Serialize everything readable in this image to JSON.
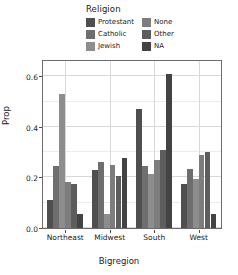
{
  "chart_data": {
    "type": "bar",
    "title": "",
    "xlabel": "Bigregion",
    "ylabel": "Prop",
    "categories": [
      "Northeast",
      "Midwest",
      "South",
      "West"
    ],
    "legend_title": "Religion",
    "legend_position": "top",
    "grid": true,
    "ylim": [
      0.0,
      0.66
    ],
    "yticks": [
      "0.0",
      "0.2",
      "0.4",
      "0.6"
    ],
    "ytick_values": [
      0.0,
      0.2,
      0.4,
      0.6
    ],
    "series": [
      {
        "name": "Protestant",
        "color": "#4f4f4f",
        "values": [
          0.11,
          0.23,
          0.47,
          0.175
        ]
      },
      {
        "name": "Catholic",
        "color": "#6e6e6e",
        "values": [
          0.245,
          0.26,
          0.245,
          0.235
        ]
      },
      {
        "name": "Jewish",
        "color": "#8d8d8d",
        "values": [
          0.53,
          0.055,
          0.215,
          0.195
        ]
      },
      {
        "name": "None",
        "color": "#7d7d7d",
        "values": [
          0.18,
          0.25,
          0.27,
          0.29
        ]
      },
      {
        "name": "Other",
        "color": "#5d5d5d",
        "values": [
          0.175,
          0.205,
          0.31,
          0.3
        ]
      },
      {
        "name": "NA",
        "color": "#434343",
        "values": [
          0.055,
          0.275,
          0.61,
          0.055
        ]
      }
    ]
  },
  "legend": {
    "title": "Religion",
    "columns": [
      [
        {
          "label": "Protestant",
          "swatch": "#4f4f4f"
        },
        {
          "label": "Catholic",
          "swatch": "#6e6e6e"
        },
        {
          "label": "Jewish",
          "swatch": "#8d8d8d"
        }
      ],
      [
        {
          "label": "None",
          "swatch": "#7d7d7d"
        },
        {
          "label": "Other",
          "swatch": "#5d5d5d"
        },
        {
          "label": "NA",
          "swatch": "#434343"
        }
      ]
    ]
  },
  "axes": {
    "y_title": "Prop",
    "x_title": "Bigregion"
  },
  "colors": {
    "panel_border": "#6b6b6b",
    "gridline": "#d8d8d8",
    "text": "#1a1a1a",
    "background": "#ffffff"
  }
}
